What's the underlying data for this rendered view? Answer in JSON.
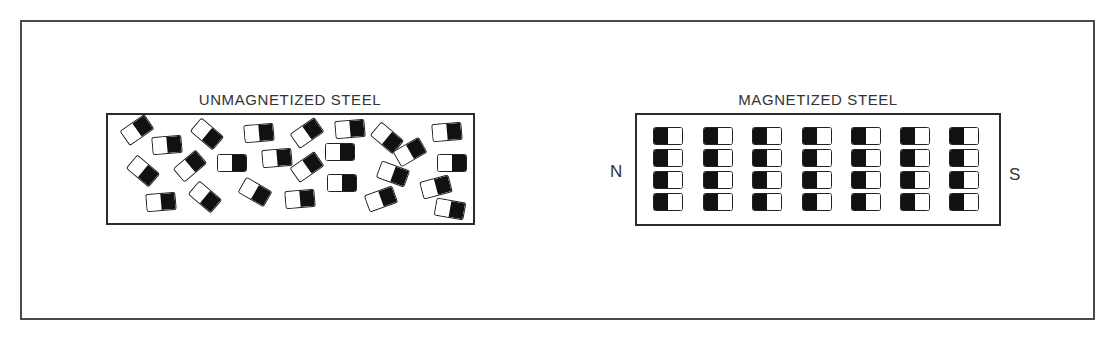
{
  "colors": {
    "frame": "#4a4a4a",
    "box_border": "#2b2b2b",
    "domain_dark": "#111111",
    "domain_light": "#ffffff",
    "text": "#333333"
  },
  "left_panel": {
    "title": "UNMAGNETIZED STEEL",
    "domain_orientation": "random",
    "domains": [
      {
        "x": 137,
        "y": 130,
        "rot": -35
      },
      {
        "x": 167,
        "y": 145,
        "rot": -5
      },
      {
        "x": 207,
        "y": 134,
        "rot": 40
      },
      {
        "x": 259,
        "y": 133,
        "rot": -5
      },
      {
        "x": 307,
        "y": 133,
        "rot": -35
      },
      {
        "x": 350,
        "y": 129,
        "rot": -5
      },
      {
        "x": 387,
        "y": 138,
        "rot": 40
      },
      {
        "x": 447,
        "y": 132,
        "rot": -5
      },
      {
        "x": 143,
        "y": 171,
        "rot": 40
      },
      {
        "x": 190,
        "y": 166,
        "rot": -40
      },
      {
        "x": 232,
        "y": 163,
        "rot": 0
      },
      {
        "x": 277,
        "y": 158,
        "rot": -5
      },
      {
        "x": 307,
        "y": 167,
        "rot": -35
      },
      {
        "x": 340,
        "y": 152,
        "rot": 0
      },
      {
        "x": 410,
        "y": 152,
        "rot": -30
      },
      {
        "x": 452,
        "y": 163,
        "rot": 0
      },
      {
        "x": 161,
        "y": 202,
        "rot": -5
      },
      {
        "x": 205,
        "y": 197,
        "rot": 40
      },
      {
        "x": 255,
        "y": 192,
        "rot": 30
      },
      {
        "x": 300,
        "y": 199,
        "rot": -5
      },
      {
        "x": 342,
        "y": 183,
        "rot": 0
      },
      {
        "x": 393,
        "y": 174,
        "rot": 20
      },
      {
        "x": 381,
        "y": 199,
        "rot": -20
      },
      {
        "x": 436,
        "y": 187,
        "rot": -15
      },
      {
        "x": 450,
        "y": 209,
        "rot": 10
      }
    ]
  },
  "right_panel": {
    "title": "MAGNETIZED STEEL",
    "domain_orientation": "aligned",
    "north_label": "N",
    "south_label": "S",
    "grid": {
      "columns": 7,
      "rows": 4,
      "col_x": [
        668,
        718,
        767,
        817,
        866,
        915,
        964
      ],
      "row_y": [
        136,
        158,
        180,
        202
      ]
    }
  }
}
